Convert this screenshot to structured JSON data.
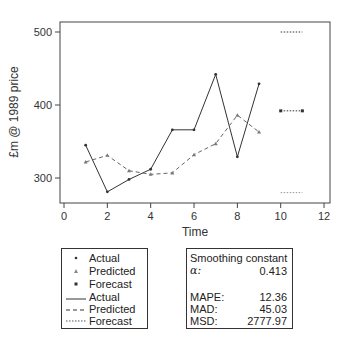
{
  "chart_data": {
    "type": "line",
    "title": "",
    "xlabel": "Time",
    "ylabel": "£m @ 1989 price",
    "xlim": [
      0,
      12
    ],
    "ylim": [
      270,
      520
    ],
    "x_ticks": [
      0,
      2,
      4,
      6,
      8,
      10,
      12
    ],
    "y_ticks": [
      300,
      400,
      500
    ],
    "grid": false,
    "legend_position": "below",
    "series": [
      {
        "name": "Actual",
        "style": "solid",
        "marker": "dot",
        "color": "#333333",
        "x": [
          1,
          2,
          3,
          4,
          5,
          6,
          7,
          8,
          9
        ],
        "values": [
          345,
          281,
          298,
          312,
          366,
          366,
          442,
          329,
          429
        ]
      },
      {
        "name": "Predicted",
        "style": "dashed",
        "marker": "triangle",
        "color": "#666666",
        "x": [
          1,
          2,
          3,
          4,
          5,
          6,
          7,
          8,
          9
        ],
        "values": [
          322,
          331,
          310,
          305,
          307,
          332,
          347,
          386,
          363
        ]
      },
      {
        "name": "Forecast",
        "style": "dotted",
        "marker": "square",
        "color": "#333333",
        "x": [
          10,
          11
        ],
        "values": [
          392,
          392
        ]
      },
      {
        "name": "Forecast upper bound",
        "style": "dotted",
        "marker": "none",
        "color": "#333333",
        "x": [
          10,
          11
        ],
        "values": [
          500,
          500
        ]
      },
      {
        "name": "Forecast lower bound",
        "style": "dotted",
        "marker": "none",
        "color": "#999999",
        "x": [
          10,
          11
        ],
        "values": [
          280,
          280
        ]
      }
    ]
  },
  "axes": {
    "x_label": "Time",
    "y_label": "£m @ 1989 price",
    "x_tick_labels": [
      "0",
      "2",
      "4",
      "6",
      "8",
      "10",
      "12"
    ],
    "y_tick_labels": [
      "300",
      "400",
      "500"
    ]
  },
  "legend": {
    "items": [
      {
        "label": "Actual",
        "symbol": "dot"
      },
      {
        "label": "Predicted",
        "symbol": "triangle"
      },
      {
        "label": "Forecast",
        "symbol": "square"
      },
      {
        "label": "Actual",
        "symbol": "solid-line"
      },
      {
        "label": "Predicted",
        "symbol": "dashed-line"
      },
      {
        "label": "Forecast",
        "symbol": "dotted-line"
      }
    ]
  },
  "stats": {
    "heading": "Smoothing constant",
    "alpha_label": "α:",
    "alpha_value": "0.413",
    "rows": [
      {
        "name": "MAPE:",
        "value": "12.36"
      },
      {
        "name": "MAD:",
        "value": "45.03"
      },
      {
        "name": "MSD:",
        "value": "2777.97"
      }
    ]
  }
}
